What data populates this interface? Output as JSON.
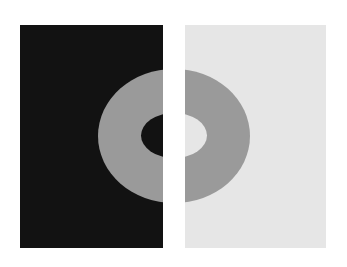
{
  "figure": {
    "type": "simultaneous-contrast-illusion",
    "background_color": "#ffffff",
    "left_panel": {
      "background_color": "#121212",
      "ring_color": "#9a9a9a",
      "hole_color": "#121212"
    },
    "right_panel": {
      "background_color": "#e6e6e6",
      "ring_color": "#9a9a9a",
      "hole_color": "#e6e6e6"
    },
    "ring": {
      "center_x": 174,
      "center_y": 135.5,
      "outer_rx": 76,
      "outer_ry": 67,
      "inner_rx": 33,
      "inner_ry": 22.5
    }
  }
}
